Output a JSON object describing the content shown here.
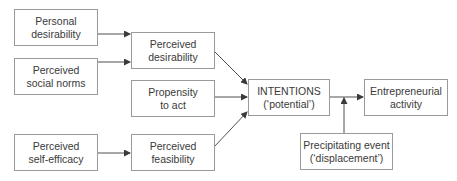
{
  "diagram": {
    "nodes": {
      "personal_desirability": {
        "line1": "Personal",
        "line2": "desirability"
      },
      "perceived_social_norms": {
        "line1": "Perceived",
        "line2": "social norms"
      },
      "perceived_self_efficacy": {
        "line1": "Perceived",
        "line2": "self-efficacy"
      },
      "perceived_desirability": {
        "line1": "Perceived",
        "line2": "desirability"
      },
      "propensity_to_act": {
        "line1": "Propensity",
        "line2": "to act"
      },
      "perceived_feasibility": {
        "line1": "Perceived",
        "line2": "feasibility"
      },
      "intentions": {
        "line1": "INTENTIONS",
        "line2": "(‘potential’)"
      },
      "entrepreneurial_activity": {
        "line1": "Entrepreneurial",
        "line2": "activity"
      },
      "precipitating_event": {
        "line1": "Precipitating event",
        "line2": "(‘displacement’)"
      }
    },
    "edges": [
      {
        "from": "Personal desirability",
        "to": "Perceived desirability"
      },
      {
        "from": "Perceived social norms",
        "to": "Perceived desirability"
      },
      {
        "from": "Perceived self-efficacy",
        "to": "Perceived feasibility"
      },
      {
        "from": "Perceived desirability",
        "to": "INTENTIONS"
      },
      {
        "from": "Propensity to act",
        "to": "INTENTIONS"
      },
      {
        "from": "Perceived feasibility",
        "to": "INTENTIONS"
      },
      {
        "from": "INTENTIONS",
        "to": "Entrepreneurial activity"
      },
      {
        "from": "Precipitating event",
        "to": "INTENTIONS → Entrepreneurial activity link"
      }
    ],
    "colors": {
      "line": "#3a3a3a",
      "border": "#9a9a9a",
      "text": "#3a3a3a"
    }
  }
}
